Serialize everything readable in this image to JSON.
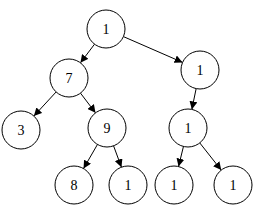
{
  "diagram": {
    "type": "tree",
    "node_radius": 19,
    "nodes": [
      {
        "id": "n0",
        "label": "1",
        "x": 106,
        "y": 29
      },
      {
        "id": "n1",
        "label": "7",
        "x": 69,
        "y": 78
      },
      {
        "id": "n2",
        "label": "1",
        "x": 200,
        "y": 70
      },
      {
        "id": "n3",
        "label": "3",
        "x": 21,
        "y": 130
      },
      {
        "id": "n4",
        "label": "9",
        "x": 107,
        "y": 128
      },
      {
        "id": "n5",
        "label": "1",
        "x": 188,
        "y": 128
      },
      {
        "id": "n6",
        "label": "8",
        "x": 74,
        "y": 185
      },
      {
        "id": "n7",
        "label": "1",
        "x": 128,
        "y": 185
      },
      {
        "id": "n8",
        "label": "1",
        "x": 174,
        "y": 185
      },
      {
        "id": "n9",
        "label": "1",
        "x": 233,
        "y": 185
      }
    ],
    "edges": [
      {
        "from": "n0",
        "to": "n1"
      },
      {
        "from": "n0",
        "to": "n2"
      },
      {
        "from": "n1",
        "to": "n3"
      },
      {
        "from": "n1",
        "to": "n4"
      },
      {
        "from": "n2",
        "to": "n5"
      },
      {
        "from": "n4",
        "to": "n6"
      },
      {
        "from": "n4",
        "to": "n7"
      },
      {
        "from": "n5",
        "to": "n8"
      },
      {
        "from": "n5",
        "to": "n9"
      }
    ]
  }
}
